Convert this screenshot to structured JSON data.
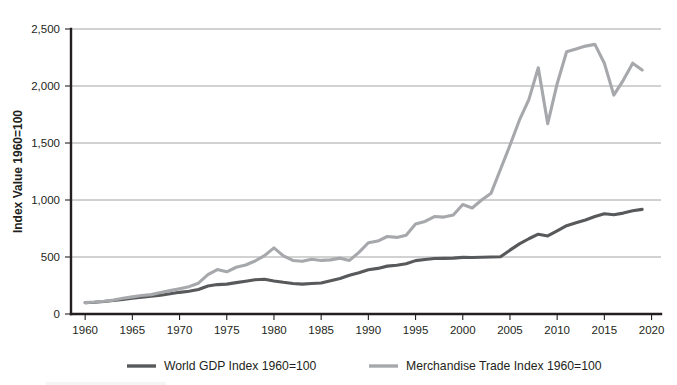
{
  "figure": {
    "name": "world-gdp-vs-merchandise-trade-index-chart",
    "background_color": "#ffffff"
  },
  "chart_data": {
    "type": "line",
    "title": "",
    "subtitle": "",
    "xlabel": "",
    "ylabel": "Index Value 1960=100",
    "xlim": [
      1958.5,
      2021
    ],
    "ylim": [
      0,
      2500
    ],
    "grid": true,
    "grid_axis": "y",
    "legend_position": "bottom",
    "x_ticks": [
      1960,
      1965,
      1970,
      1975,
      1980,
      1985,
      1990,
      1995,
      2000,
      2005,
      2010,
      2015,
      2020
    ],
    "x_tick_labels": [
      "1960",
      "1965",
      "1970",
      "1975",
      "1980",
      "1985",
      "1990",
      "1995",
      "2000",
      "2005",
      "2010",
      "2015",
      "2020"
    ],
    "y_ticks": [
      0,
      500,
      1000,
      1500,
      2000,
      2500
    ],
    "y_tick_labels": [
      "0",
      "500",
      "1,000",
      "1,500",
      "2,000",
      "2,500"
    ],
    "series": [
      {
        "name": "World GDP Index 1960=100",
        "color": "#58595b",
        "x": [
          1960,
          1961,
          1962,
          1963,
          1964,
          1965,
          1966,
          1967,
          1968,
          1969,
          1970,
          1971,
          1972,
          1973,
          1974,
          1975,
          1976,
          1977,
          1978,
          1979,
          1980,
          1981,
          1982,
          1983,
          1984,
          1985,
          1986,
          1987,
          1988,
          1989,
          1990,
          1991,
          1992,
          1993,
          1994,
          1995,
          1996,
          1997,
          1998,
          1999,
          2000,
          2001,
          2002,
          2003,
          2004,
          2005,
          2006,
          2007,
          2008,
          2009,
          2010,
          2011,
          2012,
          2013,
          2014,
          2015,
          2016,
          2017,
          2018,
          2019
        ],
        "values": [
          100,
          103,
          110,
          118,
          128,
          138,
          148,
          155,
          165,
          178,
          190,
          200,
          215,
          245,
          258,
          262,
          275,
          288,
          300,
          305,
          290,
          278,
          268,
          262,
          268,
          272,
          292,
          312,
          340,
          362,
          388,
          400,
          420,
          428,
          440,
          468,
          478,
          487,
          488,
          490,
          497,
          495,
          498,
          500,
          502,
          560,
          615,
          660,
          700,
          685,
          730,
          775,
          800,
          825,
          855,
          880,
          870,
          885,
          905,
          918
        ],
        "line_style": "solid"
      },
      {
        "name": "Merchandise Trade Index 1960=100",
        "color": "#a6a8ab",
        "x": [
          1960,
          1961,
          1962,
          1963,
          1964,
          1965,
          1966,
          1967,
          1968,
          1969,
          1970,
          1971,
          1972,
          1973,
          1974,
          1975,
          1976,
          1977,
          1978,
          1979,
          1980,
          1981,
          1982,
          1983,
          1984,
          1985,
          1986,
          1987,
          1988,
          1989,
          1990,
          1991,
          1992,
          1993,
          1994,
          1995,
          1996,
          1997,
          1998,
          1999,
          2000,
          2001,
          2002,
          2003,
          2004,
          2005,
          2006,
          2007,
          2008,
          2009,
          2010,
          2011,
          2012,
          2013,
          2014,
          2015,
          2016,
          2017,
          2018,
          2019
        ],
        "values": [
          100,
          105,
          112,
          122,
          138,
          150,
          162,
          170,
          188,
          205,
          222,
          240,
          270,
          345,
          390,
          370,
          410,
          430,
          465,
          512,
          580,
          510,
          470,
          462,
          480,
          470,
          475,
          490,
          470,
          540,
          625,
          640,
          680,
          672,
          690,
          790,
          812,
          855,
          850,
          868,
          960,
          930,
          1000,
          1060,
          1270,
          1480,
          1700,
          1880,
          2160,
          1670,
          2020,
          2300,
          2325,
          2350,
          2365,
          2200,
          1920,
          2050,
          2200,
          2140
        ],
        "line_style": "solid"
      }
    ]
  },
  "legend": {
    "items": [
      {
        "label": "World GDP Index 1960=100",
        "color": "#58595b"
      },
      {
        "label": "Merchandise Trade Index 1960=100",
        "color": "#a6a8ab"
      }
    ]
  }
}
